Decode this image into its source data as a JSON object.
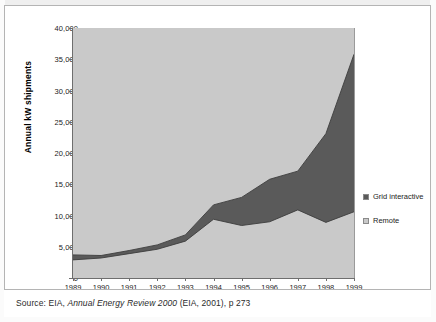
{
  "figure": {
    "source_prefix": "Source: EIA,",
    "source_italic": "Annual Energy Review 2000",
    "source_suffix": "(EIA, 2001), p 273"
  },
  "legend": {
    "position": "right",
    "items": [
      {
        "label": "Grid interactive",
        "color": "#5a5a5a"
      },
      {
        "label": "Remote",
        "color": "#c9c9c9"
      }
    ]
  },
  "chart_data": {
    "type": "area",
    "stacked": true,
    "title": "",
    "subtitle": "",
    "xlabel": "",
    "ylabel": "Annual kW shipments",
    "x": [
      1989,
      1990,
      1991,
      1992,
      1993,
      1994,
      1995,
      1996,
      1997,
      1998,
      1999
    ],
    "categories": [
      "1989",
      "1990",
      "1991",
      "1992",
      "1993",
      "1994",
      "1995",
      "1996",
      "1997",
      "1998",
      "1999"
    ],
    "series": [
      {
        "name": "Remote",
        "color": "#c9c9c9",
        "values": [
          2900,
          3200,
          3900,
          4600,
          5900,
          9400,
          8400,
          9000,
          10900,
          8900,
          10600
        ]
      },
      {
        "name": "Grid interactive",
        "color": "#5a5a5a",
        "values": [
          800,
          400,
          500,
          700,
          1000,
          2300,
          4500,
          6800,
          6200,
          14200,
          25200
        ]
      }
    ],
    "totals": [
      3700,
      3600,
      4400,
      5300,
      6900,
      11700,
      12900,
      15800,
      17100,
      23100,
      35800
    ],
    "ylim": [
      0,
      40000
    ],
    "yticks": [
      0,
      5000,
      10000,
      15000,
      20000,
      25000,
      30000,
      35000,
      40000
    ],
    "ytick_labels": [
      "0",
      "5,000",
      "10,000",
      "15,000",
      "20,000",
      "25,000",
      "30,000",
      "35,000",
      "40,000"
    ],
    "xlim": [
      1989,
      1999
    ],
    "grid": false,
    "plot_background": "#c9c9c9"
  }
}
